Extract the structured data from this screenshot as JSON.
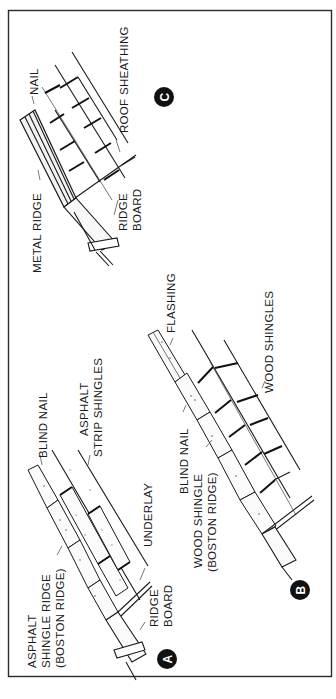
{
  "figure": {
    "orientation": "rotated 90 degrees counter-clockwise",
    "border_color": "#2a2a2a",
    "background": "#ffffff",
    "ink_color": "#1a1a1a"
  },
  "panels": [
    {
      "id": "A",
      "badge": "A",
      "title": "Asphalt shingle ridge",
      "labels": {
        "ridge_type_line1": "ASPHALT",
        "ridge_type_line2": "SHINGLE RIDGE",
        "ridge_type_line3": "(BOSTON RIDGE)",
        "blind_nail": "BLIND NAIL",
        "strip_line1": "ASPHALT",
        "strip_line2": "STRIP SHINGLES",
        "underlay": "UNDERLAY",
        "ridge_board_line1": "RIDGE",
        "ridge_board_line2": "BOARD"
      }
    },
    {
      "id": "B",
      "badge": "B",
      "title": "Wood shingle ridge",
      "labels": {
        "wood_ridge_line1": "WOOD SHINGLE",
        "wood_ridge_line2": "(BOSTON RIDGE)",
        "blind_nail": "BLIND NAIL",
        "flashing": "FLASHING",
        "wood_shingles": "WOOD SHINGLES"
      }
    },
    {
      "id": "C",
      "badge": "C",
      "title": "Metal ridge",
      "labels": {
        "metal_ridge": "METAL RIDGE",
        "nail": "NAIL",
        "ridge_board_line1": "RIDGE",
        "ridge_board_line2": "BOARD",
        "roof_sheathing": "ROOF SHEATHING"
      }
    }
  ]
}
